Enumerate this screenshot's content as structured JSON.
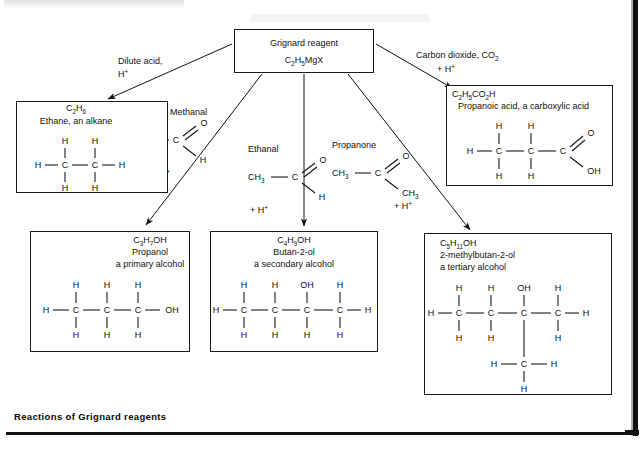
{
  "figure": {
    "caption": "Reactions of Grignard reagents"
  },
  "center": {
    "name": "Grignard reagent",
    "formula_main": "C",
    "formula": [
      {
        "t": "C"
      },
      {
        "t": "2",
        "sub": true
      },
      {
        "t": "H"
      },
      {
        "t": "5",
        "sub": true
      },
      {
        "t": "MgX"
      }
    ],
    "formula_text": "C2H5MgX"
  },
  "reagent_labels": {
    "dilute_acid_line1": "Dilute acid,",
    "dilute_acid_line2": "H",
    "dilute_acid_charge": "+",
    "carbon_dioxide": "Carbon dioxide, CO",
    "carbon_dioxide_sub": "2",
    "carbon_dioxide_plus": "+ H",
    "carbon_dioxide_plus_charge": "+",
    "methanal": "Methanal",
    "ethanal": "Ethanal",
    "propanone": "Propanone",
    "plus_h": "+ H",
    "plus_h_charge": "+"
  },
  "products": {
    "ethane": {
      "formula": "C2H6",
      "name": "Ethane, an alkane"
    },
    "propanoic_acid": {
      "formula": "C2H5CO2H",
      "name": "Propanoic acid, a carboxylic acid"
    },
    "propanol": {
      "formula": "C3H7OH",
      "name": "Propanol",
      "class": "a primary alcohol"
    },
    "butan2ol": {
      "formula": "C4H9OH",
      "name": "Butan-2-ol",
      "class": "a secondary alcohol"
    },
    "methylbutan2ol": {
      "formula": "C5H11OH",
      "name": "2-methylbutan-2-ol",
      "class": "a tertiary alcohol"
    }
  },
  "atoms": {
    "H": "H",
    "C": "C",
    "O": "O",
    "OH": "OH",
    "CH3": "CH3",
    "CH3_base": "CH",
    "CH3_sub": "3"
  },
  "colors": {
    "ink": "#111111",
    "paper": "#ffffff"
  }
}
